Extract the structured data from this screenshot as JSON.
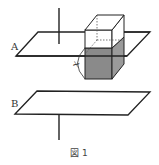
{
  "figure": {
    "caption": "図 1",
    "plane_a_label": "A",
    "plane_b_label": "B",
    "dimension_label": "x",
    "colors": {
      "line": "#222222",
      "shade_front": "#8a8a8a",
      "shade_side": "#9a9a9a",
      "background": "#ffffff"
    }
  }
}
